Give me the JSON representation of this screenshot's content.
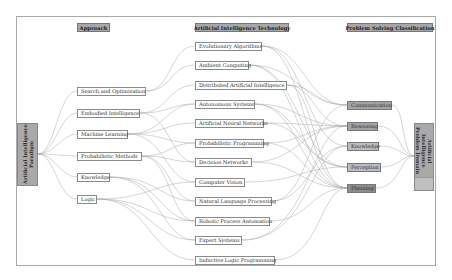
{
  "headers": {
    "approach": "Approach",
    "technology": "Artificial Intelligence Technology",
    "classification": "Problem Solving Classification"
  },
  "paradigm": {
    "label": "Artificial Intelligence Paradigm"
  },
  "domain": {
    "label": "Artificial Intelligence Problem Domain"
  },
  "approaches": [
    {
      "label": "Search and Optimisation"
    },
    {
      "label": "Embodied Intelligence"
    },
    {
      "label": "Machine Learning"
    },
    {
      "label": "Probabilistic Methods"
    },
    {
      "label": "Knowledge"
    },
    {
      "label": "Logic"
    }
  ],
  "technologies": [
    {
      "label": "Evolutionary Algorithms"
    },
    {
      "label": "Ambient Computing"
    },
    {
      "label": "Distributed Artificial Intelligence"
    },
    {
      "label": "Autonomous Systems"
    },
    {
      "label": "Artificial Neural Networks"
    },
    {
      "label": "Probabilistic Programming"
    },
    {
      "label": "Decision Networks"
    },
    {
      "label": "Computer Vision"
    },
    {
      "label": "Natural Language Processing"
    },
    {
      "label": "Robotic Process Automation"
    },
    {
      "label": "Expert Systems"
    },
    {
      "label": "Inductive Logic Programming"
    }
  ],
  "classifications": [
    {
      "label": "Communication"
    },
    {
      "label": "Reasoning"
    },
    {
      "label": "Knowledge"
    },
    {
      "label": "Perception"
    },
    {
      "label": "Planning"
    }
  ],
  "colors": {
    "header_fill": "#a8a8a8",
    "box_border": "#8a8a8a",
    "link_stroke": "#9a9a9a",
    "frame": "#a9a9a9"
  }
}
